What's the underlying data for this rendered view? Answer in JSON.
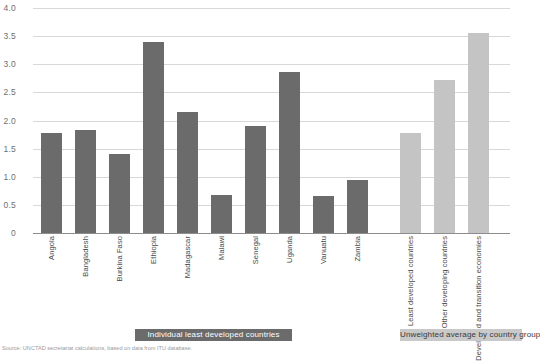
{
  "chart_data": {
    "type": "bar",
    "title": "",
    "subtitle": "",
    "xlabel": "",
    "ylabel": "",
    "ylim": [
      0,
      4.0
    ],
    "ytick_labels": [
      "4.0",
      "3.5",
      "3.0",
      "2.5",
      "2.0",
      "1.5",
      "1.0",
      "0.5",
      "0"
    ],
    "ytick_values": [
      4.0,
      3.5,
      3.0,
      2.5,
      2.0,
      1.5,
      1.0,
      0.5,
      0
    ],
    "grid": true,
    "legend_position": "bottom",
    "groups": [
      {
        "name": "Individual least developed countries",
        "color": "#6b6b6b",
        "categories": [
          "Angola",
          "Bangladesh",
          "Burkina Faso",
          "Ethiopia",
          "Madagascar",
          "Malawi",
          "Senegal",
          "Uganda",
          "Vanuatu",
          "Zambia"
        ],
        "values": [
          1.78,
          1.83,
          1.4,
          3.4,
          2.15,
          0.68,
          1.9,
          2.87,
          0.65,
          0.95
        ]
      },
      {
        "name": "Unweighted average by country group",
        "color": "#c4c4c4",
        "categories": [
          "Least developed countries",
          "Other developing countries",
          "Developed and transition economies"
        ],
        "values": [
          1.78,
          2.72,
          3.55
        ]
      }
    ]
  },
  "legend": {
    "left_label": "Individual least developed countries",
    "right_label": "Unweighted average by country group"
  },
  "footnote": {
    "text": "Source: UNCTAD secretariat calculations, based on data from ITU database."
  },
  "colors": {
    "bar_dark": "#6b6b6b",
    "bar_light": "#c4c4c4",
    "gridline": "#d8d8d8",
    "axis": "#8c8c8c"
  }
}
